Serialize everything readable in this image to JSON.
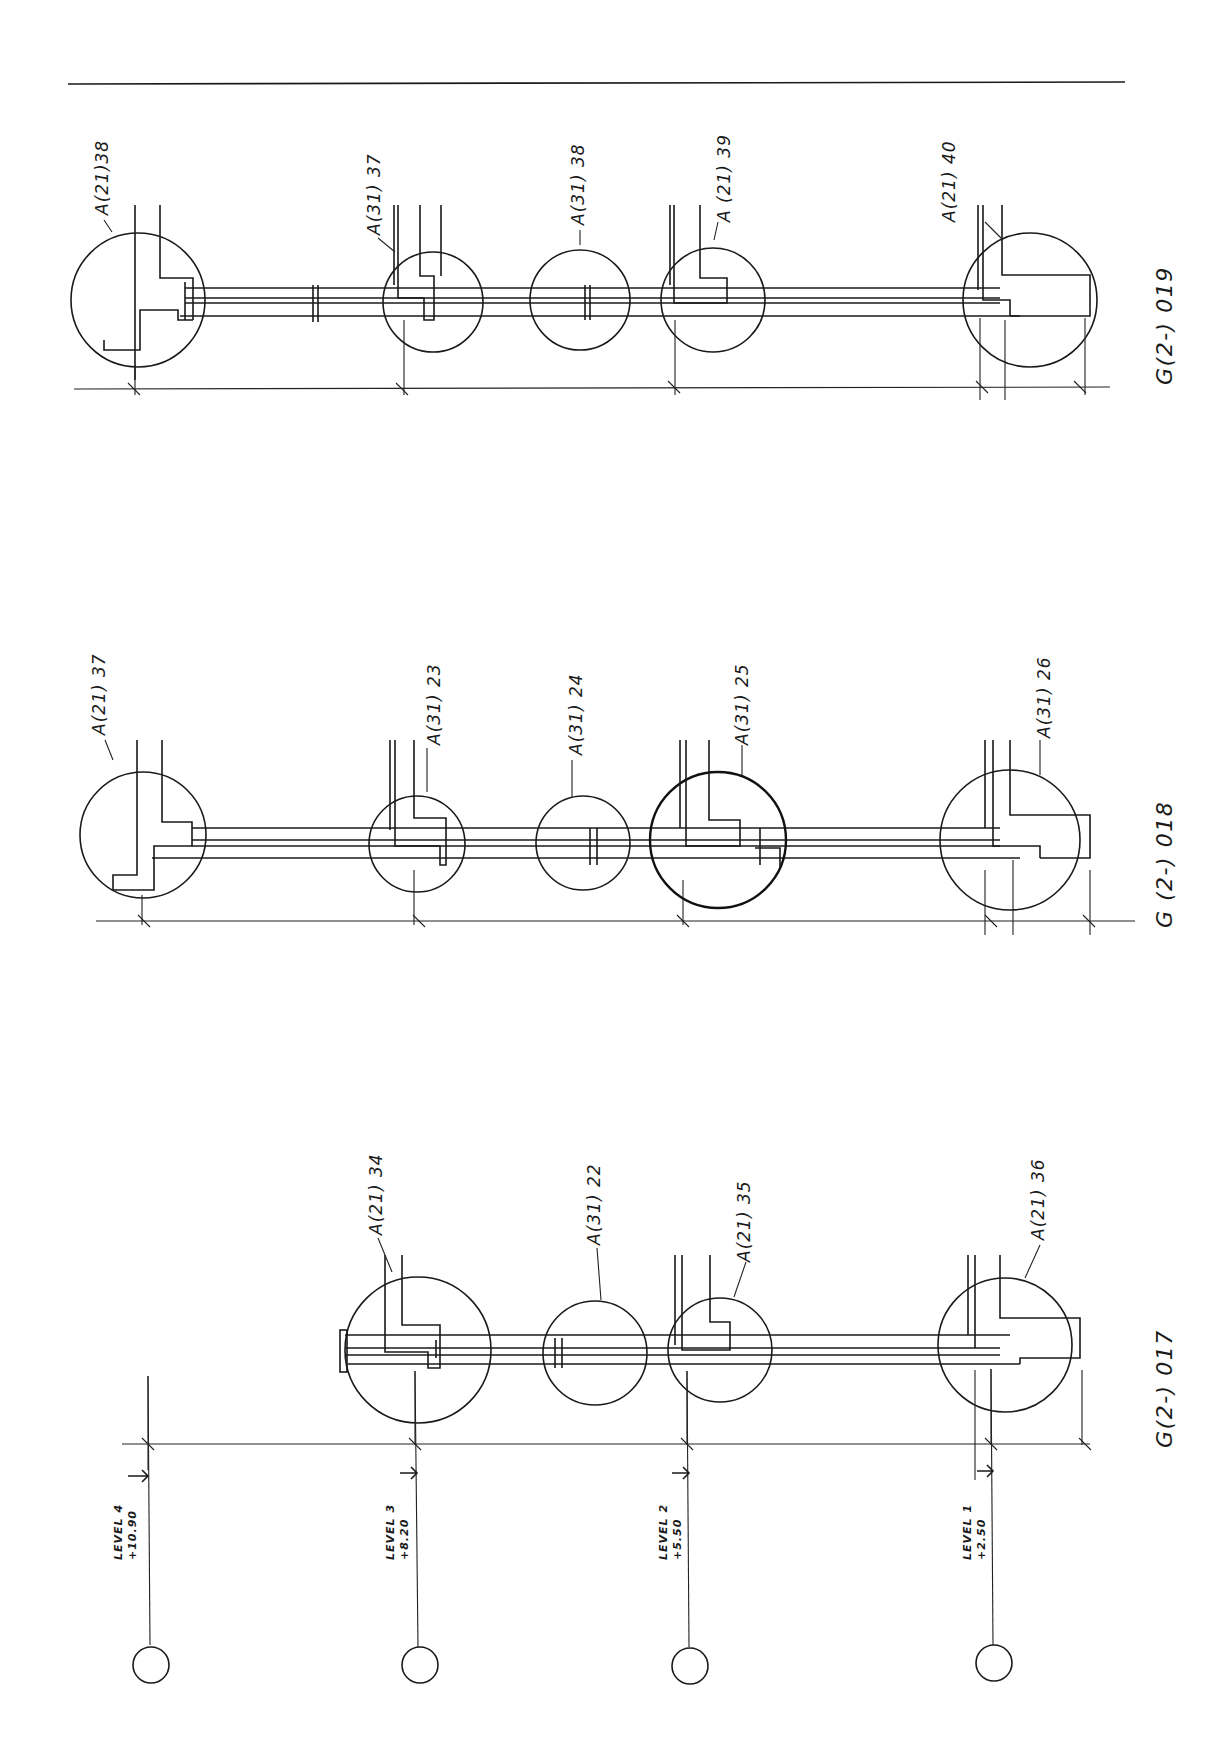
{
  "drawing": {
    "type": "architectural wall section elevations (rotated)",
    "border_line": true
  },
  "levels": [
    {
      "name": "LEVEL 4",
      "elevation": "+10.90"
    },
    {
      "name": "LEVEL 3",
      "elevation": "+8.20"
    },
    {
      "name": "LEVEL 2",
      "elevation": "+5.50"
    },
    {
      "name": "LEVEL 1",
      "elevation": "+2.50"
    }
  ],
  "sections": [
    {
      "id": "G(2-) 019",
      "details": [
        {
          "label": "A(21)38"
        },
        {
          "label": "A(31) 37"
        },
        {
          "label": "A(31) 38"
        },
        {
          "label": "A (21) 39"
        },
        {
          "label": "A(21) 40"
        }
      ]
    },
    {
      "id": "G (2-) 018",
      "details": [
        {
          "label": "A(21) 37"
        },
        {
          "label": "A(31) 23"
        },
        {
          "label": "A(31) 24"
        },
        {
          "label": "A(31) 25"
        },
        {
          "label": "A(31) 26"
        }
      ]
    },
    {
      "id": "G(2-) 017",
      "details": [
        {
          "label": "A(21) 34"
        },
        {
          "label": "A(31) 22"
        },
        {
          "label": "A(21) 35"
        },
        {
          "label": "A(21) 36"
        }
      ]
    }
  ]
}
